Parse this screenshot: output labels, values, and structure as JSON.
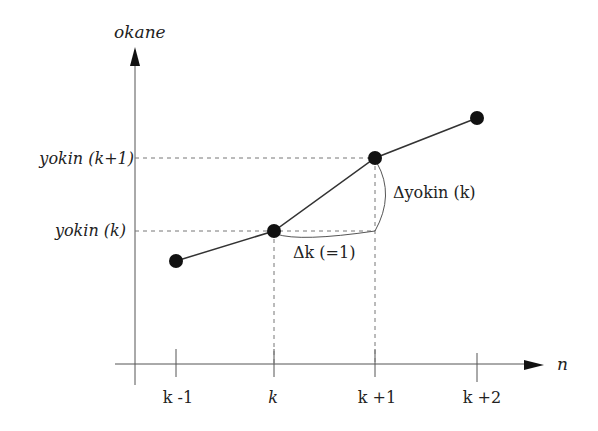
{
  "diagram": {
    "y_axis_label": "okane",
    "x_axis_label": "n",
    "y_ticks": [
      {
        "label": "yokin (k+1)",
        "pre": "yokin ",
        "var": "(k",
        "post": "+1)"
      },
      {
        "label": "yokin (k)",
        "pre": "yokin ",
        "var": "(k",
        "post": ")"
      }
    ],
    "x_ticks": [
      "k -1",
      "k",
      "k +1",
      "k +2"
    ],
    "annotations": {
      "delta_k": "Δk (=1)",
      "delta_yokin": "Δyokin (k)"
    },
    "points": [
      {
        "n": "k -1",
        "x": 176,
        "y": 261
      },
      {
        "n": "k",
        "x": 274,
        "y": 231
      },
      {
        "n": "k +1",
        "x": 375,
        "y": 158
      },
      {
        "n": "k +2",
        "x": 477,
        "y": 118
      }
    ],
    "colors": {
      "line": "#333333",
      "point": "#111111",
      "dashed": "#666666",
      "axis": "#444444"
    }
  }
}
